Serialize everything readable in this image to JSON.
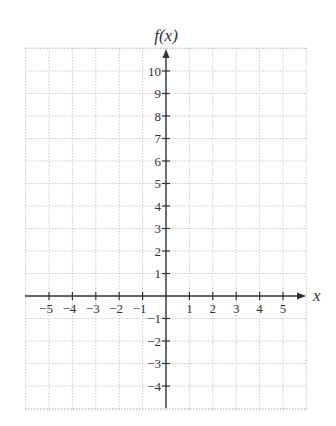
{
  "chart_data": {
    "type": "line",
    "title": "",
    "xlabel": "x",
    "ylabel": "f(x)",
    "xlim": [
      -6,
      6
    ],
    "ylim": [
      -5,
      11
    ],
    "x_ticks": [
      -5,
      -4,
      -3,
      -2,
      -1,
      1,
      2,
      3,
      4,
      5
    ],
    "y_ticks": [
      -4,
      -3,
      -2,
      -1,
      1,
      2,
      3,
      4,
      5,
      6,
      7,
      8,
      9,
      10
    ],
    "x_tick_labels": [
      "−5",
      "−4",
      "−3",
      "−2",
      "−1",
      "1",
      "2",
      "3",
      "4",
      "5"
    ],
    "y_tick_labels": [
      "−4",
      "−3",
      "−2",
      "−1",
      "1",
      "2",
      "3",
      "4",
      "5",
      "6",
      "7",
      "8",
      "9",
      "10"
    ],
    "grid": true,
    "grid_style": "dotted",
    "series": [],
    "legend": null
  },
  "labels": {
    "x_axis": "x",
    "y_axis": "f(x)"
  },
  "colors": {
    "axis": "#333333",
    "grid": "#bdbdbd",
    "background": "#ffffff"
  }
}
